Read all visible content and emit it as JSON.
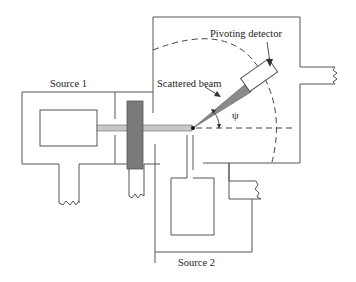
{
  "diagram": {
    "type": "scattering apparatus schematic",
    "labels": {
      "source1": "Source 1",
      "source2": "Source 2",
      "scattered_beam": "Scattered beam",
      "pivoting_detector": "Pivoting detector",
      "angle": "ψ"
    },
    "colors": {
      "outline": "#555555",
      "beam": "#c8c8c8",
      "target": "#7a7a7a",
      "scattered_beam": "#8a8a8a",
      "background": "#ffffff"
    },
    "components": [
      {
        "id": "source1-chamber",
        "label": "Source 1"
      },
      {
        "id": "source2-chamber",
        "label": "Source 2"
      },
      {
        "id": "target-block"
      },
      {
        "id": "incident-beam"
      },
      {
        "id": "scattered-beam",
        "label": "Scattered beam"
      },
      {
        "id": "pivoting-detector",
        "label": "Pivoting detector"
      },
      {
        "id": "angle-psi",
        "label": "ψ"
      }
    ]
  }
}
